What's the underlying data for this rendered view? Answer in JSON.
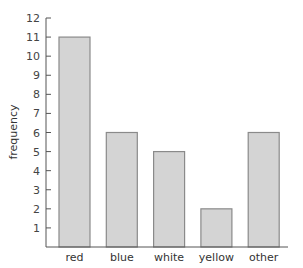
{
  "chart_data": {
    "type": "bar",
    "title": "",
    "xlabel": "",
    "ylabel": "frequency",
    "categories": [
      "red",
      "blue",
      "white",
      "yellow",
      "other"
    ],
    "values": [
      11,
      6,
      5,
      2,
      6
    ],
    "ylim": [
      0,
      12
    ],
    "yticks": [
      1,
      2,
      3,
      4,
      5,
      6,
      7,
      8,
      9,
      10,
      11,
      12
    ],
    "grid": false,
    "legend": null,
    "bar_color": "#d4d4d4",
    "bar_edge_color": "#8a8a8a"
  }
}
